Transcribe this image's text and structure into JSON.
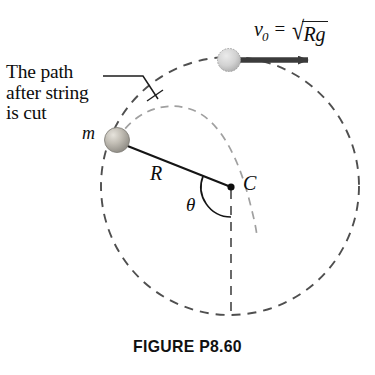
{
  "figure": {
    "caption": "FIGURE P8.60",
    "annotation": {
      "line1": "The path",
      "line2": "after string",
      "line3": "is cut"
    },
    "labels": {
      "mass": "m",
      "radius": "R",
      "center": "C",
      "angle": "θ"
    },
    "velocity": {
      "symbol": "v",
      "subscript": "0",
      "equals": "=",
      "radical_sign": "√",
      "radicand": "Rg"
    },
    "colors": {
      "ink": "#1a1a1a",
      "circle_dash": "#555555",
      "path_dash": "#9a9a9a",
      "ball_mass": "#b4b0a8",
      "ball_top": "#c9c9c9",
      "arrow": "#3a3a3a",
      "background": "#ffffff"
    }
  },
  "geometry": {
    "circle": {
      "cx": 230,
      "cy": 186,
      "r": 129
    },
    "center_point": {
      "x": 231,
      "y": 187
    },
    "mass_ball": {
      "x": 117,
      "y": 140,
      "r": 12
    },
    "top_ball": {
      "x": 229,
      "y": 60,
      "r": 11
    },
    "arrow": {
      "x1": 240,
      "y1": 60,
      "x2": 314,
      "y2": 60
    },
    "theta_arc_radius": 30,
    "leader_line": {
      "x1": 103,
      "y1": 76,
      "x2": 143,
      "y2": 76,
      "x3": 158,
      "y3": 99
    }
  }
}
